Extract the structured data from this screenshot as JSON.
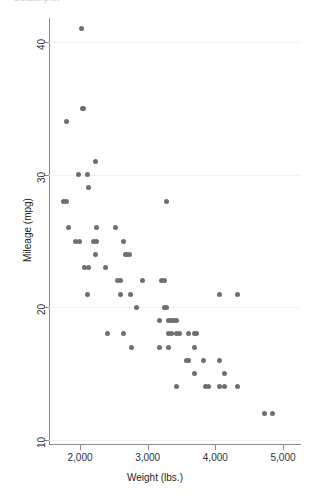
{
  "figure": {
    "clipped_title": "Scatterplot",
    "background_color": "#ffffff",
    "marker_color": "#6e6e73",
    "axis_color": "#8a8a8f"
  },
  "chart_data": {
    "type": "scatter",
    "title": "",
    "xlabel": "Weight (lbs.)",
    "ylabel": "Mileage (mpg)",
    "xlim": [
      1630,
      5000
    ],
    "ylim": [
      10,
      42
    ],
    "xticks": [
      2000,
      3000,
      4000,
      5000
    ],
    "xtick_labels": [
      "2,000",
      "3,000",
      "4,000",
      "5,000"
    ],
    "yticks": [
      10,
      20,
      30,
      40
    ],
    "ytick_labels": [
      "10",
      "20",
      "30",
      "40"
    ],
    "grid": false,
    "legend": null,
    "series": [
      {
        "name": "Automobiles",
        "marker": "circle",
        "color": "#6e6e73",
        "points": [
          [
            2020,
            41
          ],
          [
            2050,
            35
          ],
          [
            2040,
            35
          ],
          [
            1800,
            34
          ],
          [
            2230,
            31
          ],
          [
            1980,
            30
          ],
          [
            2110,
            30
          ],
          [
            2130,
            29
          ],
          [
            1760,
            28
          ],
          [
            1800,
            28
          ],
          [
            3280,
            28
          ],
          [
            1830,
            26
          ],
          [
            2240,
            26
          ],
          [
            2520,
            26
          ],
          [
            1930,
            25
          ],
          [
            1990,
            25
          ],
          [
            2200,
            25
          ],
          [
            2240,
            25
          ],
          [
            2650,
            25
          ],
          [
            2230,
            24
          ],
          [
            2670,
            24
          ],
          [
            2690,
            24
          ],
          [
            2730,
            24
          ],
          [
            2070,
            23
          ],
          [
            2130,
            23
          ],
          [
            2370,
            23
          ],
          [
            2560,
            22
          ],
          [
            2600,
            22
          ],
          [
            2930,
            22
          ],
          [
            3200,
            22
          ],
          [
            3250,
            22
          ],
          [
            2110,
            21
          ],
          [
            2600,
            21
          ],
          [
            2750,
            21
          ],
          [
            4060,
            21
          ],
          [
            4330,
            21
          ],
          [
            2830,
            20
          ],
          [
            3250,
            20
          ],
          [
            3280,
            20
          ],
          [
            3170,
            19
          ],
          [
            3310,
            19
          ],
          [
            3350,
            19
          ],
          [
            3400,
            19
          ],
          [
            3430,
            19
          ],
          [
            2410,
            18
          ],
          [
            2650,
            18
          ],
          [
            3310,
            18
          ],
          [
            3350,
            18
          ],
          [
            3430,
            18
          ],
          [
            3470,
            18
          ],
          [
            3600,
            18
          ],
          [
            3690,
            18
          ],
          [
            3720,
            18
          ],
          [
            2760,
            17
          ],
          [
            3170,
            17
          ],
          [
            3310,
            17
          ],
          [
            3690,
            17
          ],
          [
            3570,
            16
          ],
          [
            3600,
            16
          ],
          [
            3830,
            16
          ],
          [
            4060,
            16
          ],
          [
            3690,
            15
          ],
          [
            4130,
            15
          ],
          [
            3430,
            14
          ],
          [
            3850,
            14
          ],
          [
            3900,
            14
          ],
          [
            4060,
            14
          ],
          [
            4130,
            14
          ],
          [
            4330,
            14
          ],
          [
            4720,
            12
          ],
          [
            4840,
            12
          ]
        ]
      }
    ]
  }
}
